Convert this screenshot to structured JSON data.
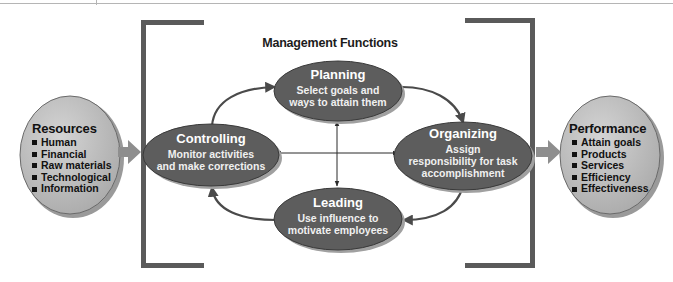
{
  "title": "Management Functions",
  "colors": {
    "bracket": "#5a5a5a",
    "function_node_fill": "#5d5d5d",
    "function_node_shadow": "#9a9a9a",
    "side_node_fill": "#bdbdbd",
    "arrow": "#4a4a4a",
    "block_arrow": "#8e8e8e",
    "text_light": "#ffffff",
    "text_dark": "#111111"
  },
  "resources": {
    "heading": "Resources",
    "items": [
      "Human",
      "Financial",
      "Raw materials",
      "Technological",
      "Information"
    ]
  },
  "performance": {
    "heading": "Performance",
    "items": [
      "Attain goals",
      "Products",
      "Services",
      "Efficiency",
      "Effectiveness"
    ]
  },
  "functions": {
    "planning": {
      "name": "Planning",
      "desc_line1": "Select goals and",
      "desc_line2": "ways to attain them"
    },
    "organizing": {
      "name": "Organizing",
      "desc_line1": "Assign",
      "desc_line2": "responsibility for task",
      "desc_line3": "accomplishment"
    },
    "leading": {
      "name": "Leading",
      "desc_line1": "Use influence to",
      "desc_line2": "motivate employees"
    },
    "controlling": {
      "name": "Controlling",
      "desc_line1": "Monitor activities",
      "desc_line2": "and make corrections"
    }
  },
  "flow": [
    {
      "from": "Resources",
      "to": "Management Functions"
    },
    {
      "from": "Planning",
      "to": "Organizing"
    },
    {
      "from": "Organizing",
      "to": "Leading"
    },
    {
      "from": "Leading",
      "to": "Controlling"
    },
    {
      "from": "Controlling",
      "to": "Planning"
    },
    {
      "from": "Management Functions",
      "to": "Performance"
    }
  ],
  "icons": {
    "bullet": "square-bullet-icon",
    "cycle_arrow": "curved-arrow-icon",
    "cross_arrow": "double-headed-arrow-icon",
    "block_arrow": "block-arrow-right-icon"
  }
}
